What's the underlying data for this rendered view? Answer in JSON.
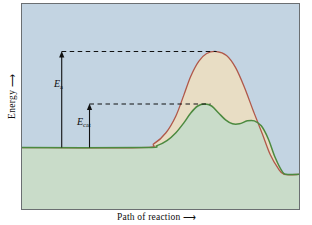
{
  "figure": {
    "type": "energy-diagram",
    "axes": {
      "ylabel": "Energy",
      "ylabel_arrow": "⟶",
      "xlabel": "Path of reaction",
      "xlabel_arrow": "⟶"
    },
    "annotations": {
      "ea": {
        "symbol": "E",
        "subscript": "a",
        "meaning": "activation energy, uncatalyzed"
      },
      "ecat": {
        "symbol": "E",
        "subscript": "cat",
        "meaning": "activation energy, catalyzed"
      }
    },
    "colors": {
      "background": "#c3d4e2",
      "plot_border": "#6b6f72",
      "uncatalyzed_curve": "#b0584a",
      "uncatalyzed_fill": "#e8ddc4",
      "catalyzed_curve": "#4c8a3f",
      "catalyzed_fill": "#c9dcc9",
      "annotation": "#111111",
      "text": "#0e0e0e"
    }
  },
  "chart_data": {
    "type": "line",
    "title": "",
    "xlabel": "Path of reaction",
    "ylabel": "Energy",
    "xlim": [
      0,
      279
    ],
    "ylim": [
      0,
      207
    ],
    "grid": false,
    "legend": null,
    "notes": [
      "Energy increases upward; reaction progress increases rightward.",
      "Both pathways start at the same reactant energy and end at the same lower product energy.",
      "The uncatalyzed path (red) has one tall transition state; the catalyzed path (green) has two lower transition states with an intermediate between them."
    ],
    "series": [
      {
        "name": "uncatalyzed",
        "color": "#b0584a",
        "fill": "#e8ddc4",
        "label": "E_a pathway",
        "points": [
          [
            0,
            145
          ],
          [
            120,
            145
          ],
          [
            133,
            141
          ],
          [
            145,
            130
          ],
          [
            155,
            113
          ],
          [
            163,
            92
          ],
          [
            170,
            73
          ],
          [
            178,
            58
          ],
          [
            186,
            50
          ],
          [
            196,
            48
          ],
          [
            206,
            52
          ],
          [
            215,
            64
          ],
          [
            224,
            84
          ],
          [
            233,
            108
          ],
          [
            242,
            131
          ],
          [
            250,
            152
          ],
          [
            258,
            166
          ],
          [
            264,
            172
          ],
          [
            279,
            172
          ]
        ]
      },
      {
        "name": "catalyzed",
        "color": "#4c8a3f",
        "fill": "#c9dcc9",
        "label": "E_cat pathway",
        "points": [
          [
            0,
            145
          ],
          [
            122,
            145
          ],
          [
            136,
            143
          ],
          [
            146,
            138
          ],
          [
            155,
            130
          ],
          [
            163,
            120
          ],
          [
            170,
            110
          ],
          [
            177,
            103
          ],
          [
            184,
            101
          ],
          [
            191,
            103
          ],
          [
            198,
            110
          ],
          [
            205,
            117
          ],
          [
            212,
            121
          ],
          [
            219,
            121
          ],
          [
            227,
            118
          ],
          [
            234,
            118
          ],
          [
            241,
            123
          ],
          [
            248,
            136
          ],
          [
            255,
            155
          ],
          [
            262,
            169
          ],
          [
            266,
            172
          ],
          [
            279,
            172
          ]
        ]
      }
    ],
    "measurements": [
      {
        "name": "Ea",
        "label": "E_a",
        "x": 40,
        "y_top": 48,
        "y_bottom": 145,
        "dash_from_x": 40,
        "dash_to_x": 196,
        "dash_y": 48
      },
      {
        "name": "Ecat",
        "label": "E_cat",
        "x": 68,
        "y_top": 101,
        "y_bottom": 145,
        "dash_from_x": 68,
        "dash_to_x": 190,
        "dash_y": 101
      }
    ]
  }
}
